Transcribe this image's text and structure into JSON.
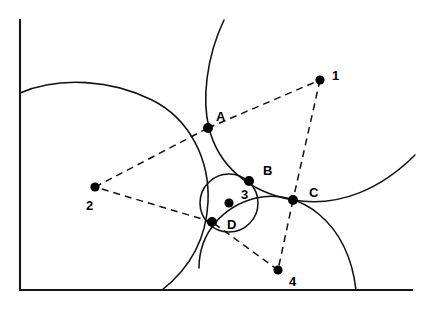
{
  "figure": {
    "width": 428,
    "height": 310,
    "background_color": "#ffffff",
    "stroke_color": "#111111",
    "frame_color": "#141414"
  },
  "frame": {
    "name": "axes-frame",
    "style": "solid",
    "left_x": 20,
    "top_y": 20,
    "bottom_y": 290,
    "right_x": 412,
    "path": "M 20 20 L 20 290 L 412 290"
  },
  "centers": [
    {
      "id": "1",
      "label": "1",
      "x": 320,
      "y": 80,
      "label_x": 332,
      "label_y": 77,
      "radius": 123,
      "arc_path": "M 224 20 C 206 58 202 100 209 128 C 218 165 248 192 293 200 C 340 208 382 188 415 155"
    },
    {
      "id": "2",
      "label": "2",
      "x": 95,
      "y": 187,
      "label_x": 86,
      "label_y": 207,
      "radius": 131,
      "arc_path": "M 20 93 C 60 76 112 80 152 100 C 190 119 210 160 208 202 C 206 244 185 272 162 290"
    },
    {
      "id": "3",
      "label": "3",
      "x": 229,
      "y": 203,
      "label_x": 241,
      "label_y": 196,
      "radius": 29,
      "arc_path": "M 258 203 A 29 29 0 1 1 200 203 A 29 29 0 1 1 258 203"
    },
    {
      "id": "4",
      "label": "4",
      "x": 278,
      "y": 270,
      "label_x": 289,
      "label_y": 283,
      "radius": 79,
      "arc_path": "M 199 268 C 199 232 224 206 256 198 C 300 188 348 222 356 290"
    }
  ],
  "tangent_points": [
    {
      "id": "A",
      "label": "A",
      "x": 208,
      "y": 128,
      "label_x": 216,
      "label_y": 118
    },
    {
      "id": "B",
      "label": "B",
      "x": 249,
      "y": 181,
      "label_x": 263,
      "label_y": 172
    },
    {
      "id": "C",
      "label": "C",
      "x": 293,
      "y": 200,
      "label_x": 309,
      "label_y": 194
    },
    {
      "id": "D",
      "label": "D",
      "x": 212,
      "y": 222,
      "label_x": 227,
      "label_y": 226
    }
  ],
  "connectors": [
    {
      "id": "2-A",
      "from": "2",
      "to": "A",
      "x1": 95,
      "y1": 187,
      "x2": 208,
      "y2": 128
    },
    {
      "id": "A-1",
      "from": "A",
      "to": "1",
      "x1": 208,
      "y1": 128,
      "x2": 320,
      "y2": 80
    },
    {
      "id": "1-C",
      "from": "1",
      "to": "C",
      "x1": 320,
      "y1": 80,
      "x2": 293,
      "y2": 200
    },
    {
      "id": "C-4",
      "from": "C",
      "to": "4",
      "x1": 293,
      "y1": 200,
      "x2": 278,
      "y2": 270
    },
    {
      "id": "4-D",
      "from": "4",
      "to": "D",
      "x1": 278,
      "y1": 270,
      "x2": 212,
      "y2": 222
    },
    {
      "id": "D-2",
      "from": "D",
      "to": "2",
      "x1": 212,
      "y1": 222,
      "x2": 95,
      "y2": 187
    }
  ]
}
